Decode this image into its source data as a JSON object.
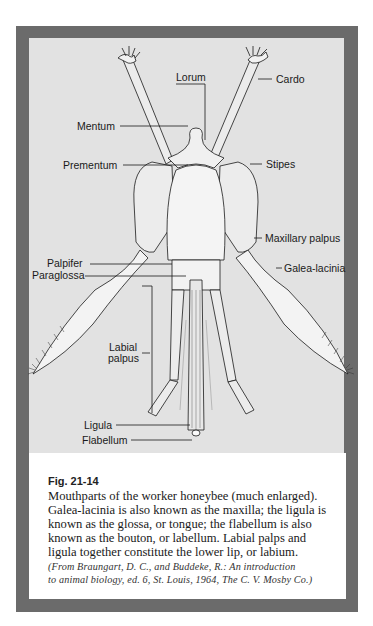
{
  "figure": {
    "labels": {
      "lorum": "Lorum",
      "cardo": "Cardo",
      "mentum": "Mentum",
      "prementum": "Prementum",
      "stipes": "Stipes",
      "maxillary_palpus": "Maxillary palpus",
      "palpifer": "Palpifer",
      "paraglossa": "Paraglossa",
      "galea_lacinia": "Galea-lacinia",
      "labial_palpus_1": "Labial",
      "labial_palpus_2": "palpus",
      "ligula": "Ligula",
      "flabellum": "Flabellum"
    },
    "colors": {
      "frame": "#6b6b6b",
      "figure_bg": "#e2e2e2",
      "caption_bg": "#ffffff",
      "ink": "#1a1a1a"
    }
  },
  "caption": {
    "figure_number": "Fig. 21-14",
    "lines": [
      "Mouthparts of the worker honeybee (much enlarged).",
      "Galea-lacinia is also known as the maxilla; the ligula is",
      "known as the glossa, or tongue; the flabellum is also",
      "known as the bouton, or labellum. Labial palps and",
      "ligula together constitute the lower lip, or labium."
    ],
    "citation": [
      "(From Braungart, D. C., and Buddeke, R.: An introduction",
      "to animal biology, ed. 6, St. Louis, 1964, The C. V. Mosby Co.)"
    ]
  }
}
